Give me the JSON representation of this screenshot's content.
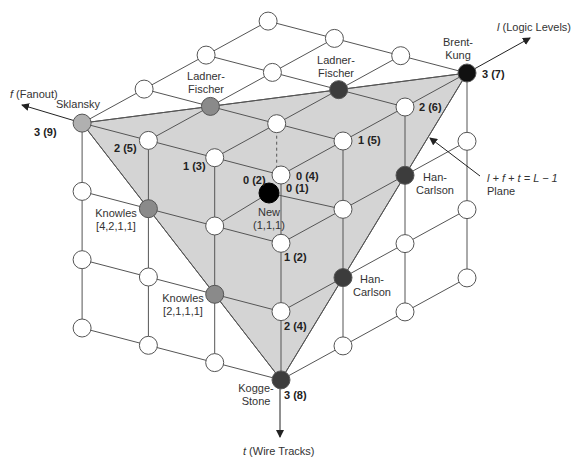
{
  "projection": {
    "origin": [
      281,
      175
    ],
    "l_step": [
      62,
      -34
    ],
    "f_step": [
      -66.3,
      -17.3
    ],
    "t_step": [
      0,
      68.3
    ],
    "node_radius": 9
  },
  "colors": {
    "line": "#555555",
    "plane": "#d4d4d4",
    "node_white": "#ffffff",
    "node_light": "#b0b0b0",
    "node_medium": "#8a8a8a",
    "node_dark": "#3c3c3c",
    "node_black": "#111111",
    "text": "#333333"
  },
  "axes": {
    "l": {
      "label_italic": "l",
      "label": " (Logic Levels)",
      "from": [
        467,
        73
      ],
      "to": [
        530,
        38
      ],
      "text_pos": [
        497,
        31
      ]
    },
    "f": {
      "label_italic": "f",
      "label": " (Fanout)",
      "from": [
        82,
        123
      ],
      "to": [
        22,
        105
      ],
      "text_pos": [
        10,
        98
      ]
    },
    "t": {
      "label_italic": "t",
      "label": " (Wire Tracks)",
      "from": [
        280,
        380
      ],
      "to": [
        280,
        437
      ],
      "text_pos": [
        243,
        455
      ]
    }
  },
  "plane": {
    "vertices": [
      [
        0,
        3,
        0
      ],
      [
        3,
        0,
        0
      ],
      [
        0,
        0,
        3
      ]
    ],
    "annotation_line1": "l + f + t = L − 1",
    "annotation_line2": "Plane",
    "annotation_pos": [
      487,
      182
    ],
    "arrow_from": [
      480,
      176
    ],
    "arrow_to": [
      430,
      138
    ]
  },
  "grid_size": 4,
  "special_nodes": [
    {
      "id": "sklansky",
      "lft": [
        0,
        3,
        0
      ],
      "fill": "light",
      "name": [
        "Sklansky"
      ],
      "name_pos": [
        56,
        108
      ],
      "anchor": "start"
    },
    {
      "id": "ladner-fischer-1",
      "lft": [
        1,
        2,
        0
      ],
      "fill": "medium",
      "name": [
        "Ladner-",
        "Fischer"
      ],
      "name_pos": [
        206,
        80
      ],
      "anchor": "middle"
    },
    {
      "id": "ladner-fischer-2",
      "lft": [
        2,
        1,
        0
      ],
      "fill": "dark",
      "name": [
        "Ladner-",
        "Fischer"
      ],
      "name_pos": [
        336,
        64
      ],
      "anchor": "middle"
    },
    {
      "id": "brent-kung",
      "lft": [
        3,
        0,
        0
      ],
      "fill": "black",
      "name": [
        "Brent-",
        "Kung"
      ],
      "name_pos": [
        458,
        46
      ],
      "anchor": "middle"
    },
    {
      "id": "han-carlson-1",
      "lft": [
        2,
        0,
        1
      ],
      "fill": "dark",
      "name": [
        "Han-",
        "Carlson"
      ],
      "name_pos": [
        435,
        181
      ],
      "anchor": "middle"
    },
    {
      "id": "han-carlson-2",
      "lft": [
        1,
        0,
        2
      ],
      "fill": "dark",
      "name": [
        "Han-",
        "Carlson"
      ],
      "name_pos": [
        372,
        283
      ],
      "anchor": "middle"
    },
    {
      "id": "knowles-4211",
      "lft": [
        0,
        2,
        1
      ],
      "fill": "medium",
      "name": [
        "Knowles",
        "[4,2,1,1]"
      ],
      "name_pos": [
        116,
        217
      ],
      "anchor": "middle"
    },
    {
      "id": "knowles-2111",
      "lft": [
        0,
        1,
        2
      ],
      "fill": "medium",
      "name": [
        "Knowles",
        "[2,1,1,1]"
      ],
      "name_pos": [
        183,
        302
      ],
      "anchor": "middle"
    },
    {
      "id": "kogge-stone",
      "lft": [
        0,
        0,
        3
      ],
      "fill": "dark",
      "name": [
        "Kogge-",
        "Stone"
      ],
      "name_pos": [
        256,
        392
      ],
      "anchor": "middle"
    }
  ],
  "new_node": {
    "pos": [
      269,
      193
    ],
    "fill": "#000000",
    "name": [
      "New",
      "(1,1,1)"
    ],
    "name_pos": [
      269,
      216
    ],
    "edges_to": [
      [
        0,
        1,
        1
      ],
      [
        1,
        0,
        1
      ]
    ],
    "dashed_to": [
      1,
      1,
      0
    ]
  },
  "value_labels": [
    {
      "text": "3 (9)",
      "pos": [
        34,
        136
      ]
    },
    {
      "text": "2 (5)",
      "pos": [
        114,
        152
      ]
    },
    {
      "text": "1 (3)",
      "pos": [
        183,
        170
      ]
    },
    {
      "text": "0 (2)",
      "pos": [
        243,
        184
      ]
    },
    {
      "text": "0 (4)",
      "pos": [
        296,
        180
      ]
    },
    {
      "text": "0 (1)",
      "pos": [
        286,
        192
      ]
    },
    {
      "text": "1 (5)",
      "pos": [
        358,
        144
      ]
    },
    {
      "text": "2 (6)",
      "pos": [
        419,
        111
      ]
    },
    {
      "text": "3 (7)",
      "pos": [
        482,
        78
      ]
    },
    {
      "text": "1 (2)",
      "pos": [
        284,
        261
      ]
    },
    {
      "text": "2 (4)",
      "pos": [
        284,
        330
      ]
    },
    {
      "text": "3 (8)",
      "pos": [
        284,
        399
      ]
    }
  ]
}
